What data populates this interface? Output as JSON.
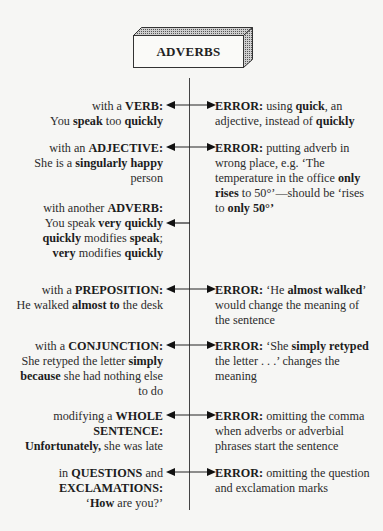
{
  "diagram": {
    "title": "ADVERBS",
    "rows": [
      {
        "id": "verb",
        "arrow_y": 105,
        "arrow": "both",
        "left_top": 99,
        "right_top": 99,
        "left": {
          "l1a": "with a ",
          "l1b": "VERB:",
          "l2a": "You ",
          "l2b": "speak",
          "l2c": " too ",
          "l2d": "quickly"
        },
        "right": {
          "r1a": "ERROR:",
          "r1b": " using ",
          "r1c": "quick",
          "r1d": ", an",
          "r2a": "adjective, instead of ",
          "r2b": "quickly"
        }
      },
      {
        "id": "adjective",
        "arrow_y": 147,
        "arrow": "both",
        "left_top": 141,
        "right_top": 141,
        "left": {
          "l1a": "with an ",
          "l1b": "ADJECTIVE:",
          "l2a": "She is a ",
          "l2b": "singularly happy",
          "l3": "person"
        },
        "right": {
          "r1a": "ERROR:",
          "r1b": " putting adverb in",
          "r2": "wrong place, e.g. ‘The",
          "r3a": "temperature in the office ",
          "r3b": "only",
          "r4a": "rises",
          "r4b": " to 50°’—should be ‘rises",
          "r5a": "to ",
          "r5b": "only 50°’"
        }
      },
      {
        "id": "adverb",
        "arrow_y": 223,
        "arrow": "left",
        "left_top": 201,
        "left": {
          "l1a": "with another ",
          "l1b": "ADVERB:",
          "l2a": "You speak ",
          "l2b": "very quickly",
          "l3a": "quickly",
          "l3b": " modifies ",
          "l3c": "speak",
          "l3d": ";",
          "l4a": "very",
          "l4b": " modifies ",
          "l4c": "quickly"
        }
      },
      {
        "id": "preposition",
        "arrow_y": 289,
        "arrow": "both",
        "left_top": 283,
        "right_top": 283,
        "left": {
          "l1a": "with a ",
          "l1b": "PREPOSITION:",
          "l2a": "He walked ",
          "l2b": "almost to",
          "l2c": " the desk"
        },
        "right": {
          "r1a": "ERROR:",
          "r1b": " ‘He ",
          "r1c": "almost walked",
          "r1d": "’",
          "r2": "would change the meaning of",
          "r3": "the sentence"
        }
      },
      {
        "id": "conjunction",
        "arrow_y": 345,
        "arrow": "both",
        "left_top": 339,
        "right_top": 339,
        "left": {
          "l1a": "with a ",
          "l1b": "CONJUNCTION:",
          "l2a": "She retyped the letter ",
          "l2b": "simply",
          "l3a": "because",
          "l3b": " she had nothing else",
          "l4": "to do"
        },
        "right": {
          "r1a": "ERROR:",
          "r1b": " ‘She ",
          "r1c": "simply retyped",
          "r2": "the letter . . .’ changes the",
          "r3": "meaning"
        }
      },
      {
        "id": "whole-sentence",
        "arrow_y": 415,
        "arrow": "both",
        "left_top": 409,
        "right_top": 409,
        "left": {
          "l1a": "modifying a ",
          "l1b": "WHOLE",
          "l2": "SENTENCE:",
          "l3a": "Unfortunately,",
          "l3b": " she was late"
        },
        "right": {
          "r1a": "ERROR:",
          "r1b": " omitting the comma",
          "r2": "when adverbs or adverbial",
          "r3": "phrases start the sentence"
        }
      },
      {
        "id": "questions",
        "arrow_y": 472,
        "arrow": "both",
        "left_top": 466,
        "right_top": 466,
        "left": {
          "l1a": "in ",
          "l1b": "QUESTIONS",
          "l1c": " and",
          "l2": "EXCLAMATIONS:",
          "l3a": "‘",
          "l3b": "How",
          "l3c": " are you?’"
        },
        "right": {
          "r1a": "ERROR:",
          "r1b": " omitting the question",
          "r2": "and exclamation marks"
        }
      }
    ]
  }
}
